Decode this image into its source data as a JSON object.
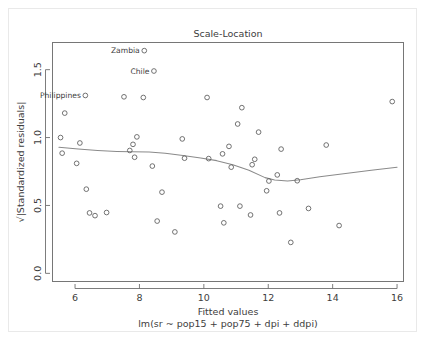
{
  "figure": {
    "title": "Scale-Location",
    "background_color": "#ffffff",
    "frame_color": "#e9e9e9"
  },
  "axes": {
    "x_title": "Fitted values",
    "x_subtitle": "lm(sr ~ pop15 + pop75 + dpi + ddpi)",
    "y_title": "√|Standardized residuals|"
  },
  "chart_data": {
    "type": "scatter",
    "title": "Scale-Location",
    "xlabel": "Fitted values",
    "xlabel_sub": "lm(sr ~ pop15 + pop75 + dpi + ddpi)",
    "ylabel": "√|Standardized residuals|",
    "xlim": [
      5.3,
      16.2
    ],
    "ylim": [
      -0.06,
      1.7
    ],
    "xticks": [
      6,
      8,
      10,
      12,
      14,
      16
    ],
    "xtick_labels": [
      "6",
      "8",
      "10",
      "12",
      "14",
      "16"
    ],
    "yticks": [
      0.0,
      0.5,
      1.0,
      1.5
    ],
    "ytick_labels": [
      "0.0",
      "0.5",
      "1.0",
      "1.5"
    ],
    "grid": false,
    "legend": "none",
    "marker": "open-circle",
    "point_color": "#5a5a5a",
    "smoother_color": "#8a8a8a",
    "points": [
      {
        "x": 5.55,
        "y": 1.0
      },
      {
        "x": 5.6,
        "y": 0.885
      },
      {
        "x": 5.68,
        "y": 1.18
      },
      {
        "x": 6.05,
        "y": 0.81
      },
      {
        "x": 6.15,
        "y": 0.96
      },
      {
        "x": 6.32,
        "y": 1.31,
        "label": "Philippines"
      },
      {
        "x": 6.35,
        "y": 0.62
      },
      {
        "x": 6.45,
        "y": 0.445
      },
      {
        "x": 6.62,
        "y": 0.425
      },
      {
        "x": 6.98,
        "y": 0.448
      },
      {
        "x": 7.52,
        "y": 1.3
      },
      {
        "x": 7.7,
        "y": 0.905
      },
      {
        "x": 7.8,
        "y": 0.95
      },
      {
        "x": 7.85,
        "y": 0.855
      },
      {
        "x": 7.92,
        "y": 1.005
      },
      {
        "x": 8.12,
        "y": 1.295
      },
      {
        "x": 8.15,
        "y": 1.64,
        "label": "Zambia"
      },
      {
        "x": 8.4,
        "y": 0.79
      },
      {
        "x": 8.45,
        "y": 1.49,
        "label": "Chile"
      },
      {
        "x": 8.55,
        "y": 0.385
      },
      {
        "x": 8.7,
        "y": 0.598
      },
      {
        "x": 9.1,
        "y": 0.305
      },
      {
        "x": 9.33,
        "y": 0.99
      },
      {
        "x": 9.4,
        "y": 0.848
      },
      {
        "x": 10.1,
        "y": 1.295
      },
      {
        "x": 10.15,
        "y": 0.845
      },
      {
        "x": 10.52,
        "y": 0.495
      },
      {
        "x": 10.58,
        "y": 0.88
      },
      {
        "x": 10.62,
        "y": 0.372
      },
      {
        "x": 10.78,
        "y": 0.935
      },
      {
        "x": 10.85,
        "y": 0.782
      },
      {
        "x": 11.05,
        "y": 1.1
      },
      {
        "x": 11.12,
        "y": 0.495
      },
      {
        "x": 11.18,
        "y": 1.22
      },
      {
        "x": 11.45,
        "y": 0.43
      },
      {
        "x": 11.5,
        "y": 0.8
      },
      {
        "x": 11.58,
        "y": 0.84
      },
      {
        "x": 11.7,
        "y": 1.04
      },
      {
        "x": 11.95,
        "y": 0.608
      },
      {
        "x": 12.02,
        "y": 0.68
      },
      {
        "x": 12.28,
        "y": 0.725
      },
      {
        "x": 12.35,
        "y": 0.445
      },
      {
        "x": 12.4,
        "y": 0.915
      },
      {
        "x": 12.7,
        "y": 0.228
      },
      {
        "x": 12.9,
        "y": 0.682
      },
      {
        "x": 13.25,
        "y": 0.478
      },
      {
        "x": 13.8,
        "y": 0.945
      },
      {
        "x": 14.2,
        "y": 0.352
      },
      {
        "x": 15.85,
        "y": 1.265
      }
    ],
    "smoother": [
      {
        "x": 5.5,
        "y": 0.928
      },
      {
        "x": 6.1,
        "y": 0.915
      },
      {
        "x": 6.7,
        "y": 0.905
      },
      {
        "x": 7.3,
        "y": 0.898
      },
      {
        "x": 7.75,
        "y": 0.895
      },
      {
        "x": 8.3,
        "y": 0.893
      },
      {
        "x": 8.8,
        "y": 0.885
      },
      {
        "x": 9.35,
        "y": 0.868
      },
      {
        "x": 9.9,
        "y": 0.85
      },
      {
        "x": 10.4,
        "y": 0.83
      },
      {
        "x": 10.9,
        "y": 0.8
      },
      {
        "x": 11.4,
        "y": 0.76
      },
      {
        "x": 11.9,
        "y": 0.705
      },
      {
        "x": 12.2,
        "y": 0.688
      },
      {
        "x": 12.6,
        "y": 0.68
      },
      {
        "x": 13.0,
        "y": 0.69
      },
      {
        "x": 13.6,
        "y": 0.712
      },
      {
        "x": 14.4,
        "y": 0.735
      },
      {
        "x": 15.2,
        "y": 0.76
      },
      {
        "x": 16.0,
        "y": 0.782
      }
    ],
    "annotations": [
      {
        "text": "Zambia",
        "x": 8.15,
        "y": 1.64
      },
      {
        "text": "Chile",
        "x": 8.45,
        "y": 1.49
      },
      {
        "text": "Philippines",
        "x": 6.32,
        "y": 1.31
      }
    ]
  }
}
